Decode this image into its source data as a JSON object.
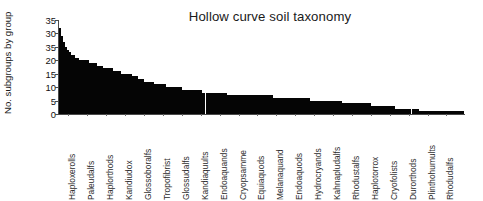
{
  "chart_data": {
    "type": "bar",
    "title": "Hollow curve soil taxonomy",
    "xlabel": "",
    "ylabel": "No. subgroups by group",
    "ylim": [
      0,
      35
    ],
    "grid": false,
    "legend": null,
    "bar_color": "#050505",
    "axis_color": "#4a4a4a",
    "y_ticks": [
      35,
      30,
      35,
      20,
      15,
      10,
      5,
      0
    ],
    "y_tick_labels": [
      "35",
      "30",
      "35",
      "20",
      "15",
      "10",
      "5",
      "0"
    ],
    "x_tick_labels": [
      "Haploxerolls",
      "Paleudalfs",
      "Haplorthods",
      "Kandiudox",
      "Glossoboralfs",
      "Tropofibrist",
      "Glossudalfs",
      "Kandiaquults",
      "Endoaquands",
      "Cryopsamme",
      "Equiaquods",
      "Melanaquand",
      "Endoaquods",
      "Hydrocryands",
      "Kahnapludalfs",
      "Rhodustalfs",
      "Haplotorrox",
      "Cryofolists",
      "Durorthods",
      "Plinthohumults",
      "Rhodudalfs"
    ],
    "categories": [
      "Haploxerolls",
      "b2",
      "b3",
      "b4",
      "b5",
      "b6",
      "b7",
      "b8",
      "b9",
      "b10",
      "Paleudalfs",
      "b12",
      "b13",
      "b14",
      "b15",
      "b16",
      "b17",
      "b18",
      "b19",
      "b20",
      "Haplorthods",
      "b22",
      "b23",
      "b24",
      "b25",
      "b26",
      "b27",
      "b28",
      "b29",
      "b30",
      "Kandiudox",
      "b32",
      "b33",
      "b34",
      "b35",
      "b36",
      "b37",
      "b38",
      "b39",
      "b40",
      "Glossoboralfs",
      "b42",
      "b43",
      "b44",
      "b45",
      "b46",
      "b47",
      "b48",
      "b49",
      "b50",
      "Tropofibrist",
      "b52",
      "b53",
      "b54",
      "b55",
      "b56",
      "b57",
      "b58",
      "b59",
      "b60",
      "Glossudalfs",
      "b62",
      "b63",
      "b64",
      "b65",
      "b66",
      "b67",
      "b68",
      "b69",
      "b70",
      "Kandiaquults",
      "b72",
      "b73",
      "b74",
      "b75",
      "b76",
      "b77",
      "b78",
      "b79",
      "b80",
      "Endoaquands",
      "b82",
      "b83",
      "b84",
      "b85",
      "b86",
      "b87",
      "b88",
      "b89",
      "b90",
      "Cryopsamme",
      "b92",
      "b93",
      "b94",
      "b95",
      "b96",
      "b97",
      "b98",
      "b99",
      "b100",
      "Equiaquods",
      "b102",
      "b103",
      "b104",
      "b105",
      "b106",
      "b107",
      "b108",
      "b109",
      "b110",
      "Melanaquand",
      "b112",
      "b113",
      "b114",
      "b115",
      "b116",
      "b117",
      "b118",
      "b119",
      "b120",
      "Endoaquods",
      "b122",
      "b123",
      "b124",
      "b125",
      "b126",
      "b127",
      "b128",
      "b129",
      "b130",
      "Hydrocryands",
      "b132",
      "b133",
      "b134",
      "b135",
      "b136",
      "b137",
      "b138",
      "b139",
      "b140",
      "Kahnapludalfs",
      "b142",
      "b143",
      "b144",
      "b145",
      "b146",
      "b147",
      "b148",
      "b149",
      "b150",
      "Rhodustalfs",
      "b152",
      "b153",
      "b154",
      "b155",
      "b156",
      "b157",
      "b158",
      "b159",
      "b160",
      "Haplotorrox",
      "b162",
      "b163",
      "b164",
      "b165",
      "b166",
      "b167",
      "b168",
      "b169",
      "b170",
      "Cryofolists",
      "b172",
      "b173",
      "b174",
      "b175",
      "b176",
      "b177",
      "b178",
      "b179",
      "b180",
      "Durorthods",
      "b182",
      "b183",
      "b184",
      "b185",
      "b186",
      "b187",
      "b188",
      "b189",
      "b190",
      "Plinthohumults",
      "b192",
      "b193",
      "b194",
      "b195",
      "b196",
      "b197",
      "b198",
      "b199",
      "b200",
      "Rhodudalfs",
      "b202",
      "b203",
      "b204",
      "b205"
    ],
    "values": [
      32,
      29,
      27,
      25,
      24,
      23,
      22,
      22,
      21,
      21,
      20,
      20,
      20,
      20,
      20,
      19,
      19,
      19,
      19,
      18,
      18,
      18,
      17,
      17,
      17,
      17,
      17,
      16,
      16,
      16,
      16,
      15,
      15,
      15,
      15,
      15,
      15,
      14,
      14,
      14,
      13,
      13,
      13,
      12,
      12,
      12,
      12,
      12,
      11,
      11,
      11,
      11,
      11,
      11,
      10,
      10,
      10,
      10,
      10,
      10,
      10,
      10,
      9,
      9,
      9,
      9,
      9,
      9,
      9,
      9,
      9,
      9,
      8,
      8,
      8,
      8,
      8,
      8,
      8,
      8,
      8,
      8,
      8,
      8,
      8,
      7,
      7,
      7,
      7,
      7,
      7,
      7,
      7,
      7,
      7,
      7,
      7,
      7,
      7,
      7,
      7,
      7,
      7,
      7,
      7,
      7,
      7,
      7,
      6,
      6,
      6,
      6,
      6,
      6,
      6,
      6,
      6,
      6,
      6,
      6,
      6,
      6,
      6,
      6,
      6,
      6,
      6,
      5,
      5,
      5,
      5,
      5,
      5,
      5,
      5,
      5,
      5,
      5,
      5,
      5,
      5,
      5,
      5,
      4,
      4,
      4,
      4,
      4,
      4,
      4,
      4,
      4,
      4,
      4,
      4,
      4,
      4,
      4,
      3,
      3,
      3,
      3,
      3,
      3,
      3,
      3,
      3,
      3,
      3,
      3,
      2,
      2,
      2,
      2,
      2,
      2,
      2,
      2,
      2,
      2,
      2,
      2,
      1,
      1,
      1,
      1,
      1,
      1,
      1,
      1,
      1,
      1,
      1,
      1,
      1,
      1,
      1,
      1,
      1,
      1,
      1,
      1,
      1,
      1,
      1
    ],
    "gap_positions": [
      74,
      178
    ],
    "annotations": []
  }
}
